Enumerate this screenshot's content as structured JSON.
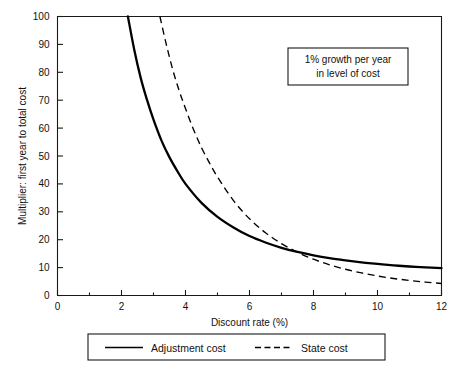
{
  "chart_data": {
    "type": "line",
    "title": "",
    "xlabel": "Discount rate (%)",
    "ylabel": "Multiplier: first year to total cost",
    "xlim": [
      0,
      12
    ],
    "ylim": [
      0,
      100
    ],
    "xticks": [
      0,
      2,
      4,
      6,
      8,
      10,
      12
    ],
    "xtick_labels": [
      "0",
      "2",
      "4",
      "6",
      "8",
      "10",
      "12"
    ],
    "xminor_step": 1,
    "yticks": [
      0,
      10,
      20,
      30,
      40,
      50,
      60,
      70,
      80,
      90,
      100
    ],
    "ytick_labels": [
      "0",
      "10",
      "20",
      "30",
      "40",
      "50",
      "60",
      "70",
      "80",
      "90",
      "100"
    ],
    "grid": false,
    "legend_position": "below-axes",
    "annotations": [
      {
        "name": "growth-note",
        "lines": [
          "1% growth per year",
          "in level of cost"
        ],
        "x": 9.7,
        "y": 83
      }
    ],
    "series": [
      {
        "name": "Adjustment cost",
        "style": "solid",
        "color": "#000000",
        "x": [
          2.2,
          2.4,
          2.6,
          2.8,
          3.0,
          3.25,
          3.5,
          3.75,
          4.0,
          4.5,
          5.0,
          5.5,
          6.0,
          6.5,
          7.0,
          7.5,
          8.0,
          8.5,
          9.0,
          9.5,
          10.0,
          10.5,
          11.0,
          11.5,
          12.0
        ],
        "y": [
          100,
          88,
          78,
          70,
          63,
          55.5,
          49.5,
          44.5,
          40.0,
          33.2,
          28.2,
          24.4,
          21.3,
          19.0,
          17.1,
          15.6,
          14.4,
          13.4,
          12.6,
          11.9,
          11.3,
          10.8,
          10.4,
          10.1,
          9.8
        ]
      },
      {
        "name": "State cost",
        "style": "dashed",
        "color": "#000000",
        "x": [
          3.2,
          3.4,
          3.6,
          3.8,
          4.0,
          4.25,
          4.5,
          4.75,
          5.0,
          5.5,
          6.0,
          6.5,
          7.0,
          7.5,
          8.0,
          8.5,
          9.0,
          9.5,
          10.0,
          10.5,
          11.0,
          11.5,
          12.0
        ],
        "y": [
          100,
          90,
          81,
          73.5,
          67,
          59.5,
          53.0,
          47.5,
          42.5,
          34.0,
          27.5,
          22.5,
          18.6,
          15.5,
          13.0,
          11.0,
          9.4,
          8.1,
          7.0,
          6.1,
          5.4,
          4.8,
          4.3
        ]
      }
    ]
  },
  "legend": {
    "entries": [
      {
        "label": "Adjustment cost",
        "style": "solid"
      },
      {
        "label": "State cost",
        "style": "dashed"
      }
    ]
  }
}
